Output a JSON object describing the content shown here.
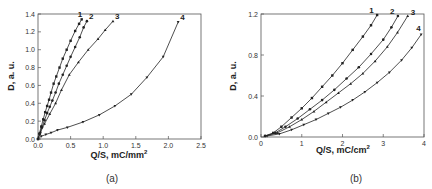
{
  "chart_data": [
    {
      "type": "line",
      "panel": "(a)",
      "caption": "(a)",
      "xlabel": "Q/S, mC/mm",
      "xlabel_sup": "2",
      "ylabel": "D, a. u.",
      "xlim": [
        0,
        2.5
      ],
      "ylim": [
        0,
        1.4
      ],
      "xticks": [
        "0.0",
        "0.5",
        "1.0",
        "1.5",
        "2.0",
        "2.5"
      ],
      "yticks": [
        "0.0",
        "0.2",
        "0.4",
        "0.6",
        "0.8",
        "1.0",
        "1.2",
        "1.4"
      ],
      "grid": false,
      "legend": "inline curve numbers",
      "series": [
        {
          "name": "1",
          "marker": "square",
          "x": [
            0.0,
            0.02,
            0.05,
            0.08,
            0.11,
            0.14,
            0.17,
            0.2,
            0.24,
            0.28,
            0.33,
            0.38,
            0.44,
            0.5,
            0.57,
            0.63,
            0.67
          ],
          "y": [
            0.0,
            0.06,
            0.14,
            0.22,
            0.3,
            0.37,
            0.44,
            0.52,
            0.62,
            0.7,
            0.8,
            0.9,
            1.0,
            1.1,
            1.21,
            1.29,
            1.34
          ]
        },
        {
          "name": "2",
          "marker": "circle",
          "x": [
            0.0,
            0.03,
            0.06,
            0.1,
            0.14,
            0.18,
            0.22,
            0.27,
            0.32,
            0.38,
            0.44,
            0.5,
            0.57,
            0.64,
            0.7,
            0.75
          ],
          "y": [
            0.0,
            0.06,
            0.13,
            0.21,
            0.29,
            0.36,
            0.43,
            0.52,
            0.62,
            0.72,
            0.82,
            0.92,
            1.03,
            1.14,
            1.25,
            1.32
          ]
        },
        {
          "name": "3",
          "marker": "triangle",
          "x": [
            0.0,
            0.04,
            0.1,
            0.18,
            0.27,
            0.36,
            0.48,
            0.62,
            0.77,
            0.92,
            1.03,
            1.15
          ],
          "y": [
            0.0,
            0.08,
            0.17,
            0.28,
            0.4,
            0.55,
            0.72,
            0.86,
            1.0,
            1.12,
            1.22,
            1.32
          ]
        },
        {
          "name": "4",
          "marker": "triangle-down",
          "x": [
            0.0,
            0.05,
            0.12,
            0.2,
            0.3,
            0.45,
            0.69,
            0.94,
            1.18,
            1.43,
            1.67,
            1.92,
            2.15
          ],
          "y": [
            0.0,
            0.03,
            0.05,
            0.07,
            0.1,
            0.13,
            0.19,
            0.27,
            0.37,
            0.5,
            0.69,
            0.92,
            1.31
          ]
        }
      ]
    },
    {
      "type": "line",
      "panel": "(b)",
      "caption": "(b)",
      "xlabel": "Q/S, mC/cm",
      "xlabel_sup": "2",
      "ylabel": "D, a. u.",
      "xlim": [
        0,
        4
      ],
      "ylim": [
        0,
        1.2
      ],
      "xticks": [
        "0",
        "1",
        "2",
        "3",
        "4"
      ],
      "yticks": [
        "0.0",
        "0.4",
        "0.8",
        "1.2"
      ],
      "grid": false,
      "legend": "inline curve numbers",
      "series": [
        {
          "name": "1",
          "marker": "square",
          "x": [
            0.1,
            0.3,
            0.5,
            0.75,
            1.0,
            1.25,
            1.5,
            1.75,
            2.0,
            2.25,
            2.5,
            2.7,
            2.85
          ],
          "y": [
            0.01,
            0.04,
            0.1,
            0.19,
            0.28,
            0.38,
            0.49,
            0.6,
            0.72,
            0.85,
            0.98,
            1.09,
            1.19
          ]
        },
        {
          "name": "2",
          "marker": "circle",
          "x": [
            0.1,
            0.35,
            0.6,
            0.9,
            1.2,
            1.5,
            1.8,
            2.1,
            2.4,
            2.7,
            3.0,
            3.2,
            3.36
          ],
          "y": [
            0.01,
            0.04,
            0.1,
            0.18,
            0.27,
            0.36,
            0.46,
            0.57,
            0.68,
            0.81,
            0.95,
            1.07,
            1.18
          ]
        },
        {
          "name": "3",
          "marker": "triangle",
          "x": [
            0.1,
            0.4,
            0.7,
            1.0,
            1.3,
            1.6,
            1.9,
            2.2,
            2.5,
            2.8,
            3.1,
            3.35,
            3.6
          ],
          "y": [
            0.01,
            0.04,
            0.1,
            0.17,
            0.25,
            0.34,
            0.43,
            0.52,
            0.62,
            0.74,
            0.88,
            1.02,
            1.18
          ]
        },
        {
          "name": "4",
          "marker": "triangle-down",
          "x": [
            0.15,
            0.45,
            0.75,
            1.05,
            1.35,
            1.65,
            1.95,
            2.25,
            2.55,
            2.85,
            3.15,
            3.45,
            3.7,
            3.93
          ],
          "y": [
            0.01,
            0.03,
            0.07,
            0.12,
            0.17,
            0.23,
            0.29,
            0.36,
            0.44,
            0.53,
            0.63,
            0.75,
            0.87,
            1.0
          ]
        }
      ]
    }
  ]
}
